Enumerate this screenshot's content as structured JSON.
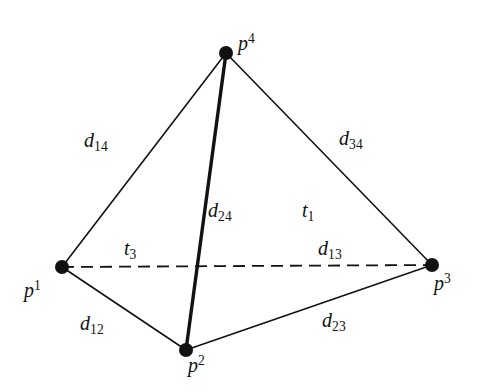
{
  "figure": {
    "background_color": "#ffffff",
    "ink_color": "#121212",
    "width": 484,
    "height": 392
  },
  "vertices": [
    {
      "id": "p1",
      "label_base": "p",
      "label_sup": "1",
      "x": 62,
      "y": 267,
      "dot_r": 7
    },
    {
      "id": "p2",
      "label_base": "p",
      "label_sup": "2",
      "x": 186,
      "y": 350,
      "dot_r": 7
    },
    {
      "id": "p3",
      "label_base": "p",
      "label_sup": "3",
      "x": 432,
      "y": 265,
      "dot_r": 7
    },
    {
      "id": "p4",
      "label_base": "p",
      "label_sup": "4",
      "x": 226,
      "y": 53,
      "dot_r": 7
    }
  ],
  "edges": [
    {
      "id": "d14",
      "from": "p1",
      "to": "p4",
      "style": "solid",
      "width": 1.6,
      "label_base": "d",
      "label_sub": "14"
    },
    {
      "id": "d34",
      "from": "p3",
      "to": "p4",
      "style": "solid",
      "width": 1.6,
      "label_base": "d",
      "label_sub": "34"
    },
    {
      "id": "d24",
      "from": "p2",
      "to": "p4",
      "style": "solid",
      "width": 3.4,
      "label_base": "d",
      "label_sub": "24"
    },
    {
      "id": "d13",
      "from": "p1",
      "to": "p3",
      "style": "dashed",
      "width": 1.8,
      "label_base": "d",
      "label_sub": "13"
    },
    {
      "id": "d12",
      "from": "p1",
      "to": "p2",
      "style": "solid",
      "width": 1.6,
      "label_base": "d",
      "label_sub": "12"
    },
    {
      "id": "d23",
      "from": "p2",
      "to": "p3",
      "style": "solid",
      "width": 1.6,
      "label_base": "d",
      "label_sub": "23"
    }
  ],
  "faces": [
    {
      "id": "t1",
      "label_base": "t",
      "label_sub": "1"
    },
    {
      "id": "t3",
      "label_base": "t",
      "label_sub": "3"
    }
  ],
  "labels": {
    "d14_base": "d",
    "d14_sub": "14",
    "d34_base": "d",
    "d34_sub": "34",
    "d24_base": "d",
    "d24_sub": "24",
    "d13_base": "d",
    "d13_sub": "13",
    "d12_base": "d",
    "d12_sub": "12",
    "d23_base": "d",
    "d23_sub": "23",
    "t1_base": "t",
    "t1_sub": "1",
    "t3_base": "t",
    "t3_sub": "3",
    "p1_base": "p",
    "p1_sup": "1",
    "p2_base": "p",
    "p2_sup": "2",
    "p3_base": "p",
    "p3_sup": "3",
    "p4_base": "p",
    "p4_sup": "4"
  }
}
